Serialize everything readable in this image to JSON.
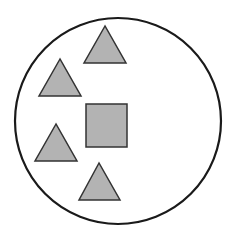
{
  "diagram": {
    "background": "#ffffff",
    "circle": {
      "cx": 118,
      "cy": 121,
      "r": 103,
      "stroke": "#1a1a1a",
      "stroke_width": 2.2,
      "fill": "#ffffff"
    },
    "shape_fill": "#b3b3b3",
    "shape_stroke": "#333333",
    "square": {
      "x": 86,
      "y": 104,
      "w": 41,
      "h": 43
    },
    "triangles": [
      {
        "points": "105,26 84,63 126,63"
      },
      {
        "points": "60,59 39,96 81,96"
      },
      {
        "points": "56,124 35,161 77,161"
      },
      {
        "points": "99,163 79,200 120,200"
      }
    ],
    "counts": {
      "triangles": 4,
      "squares": 1
    }
  }
}
